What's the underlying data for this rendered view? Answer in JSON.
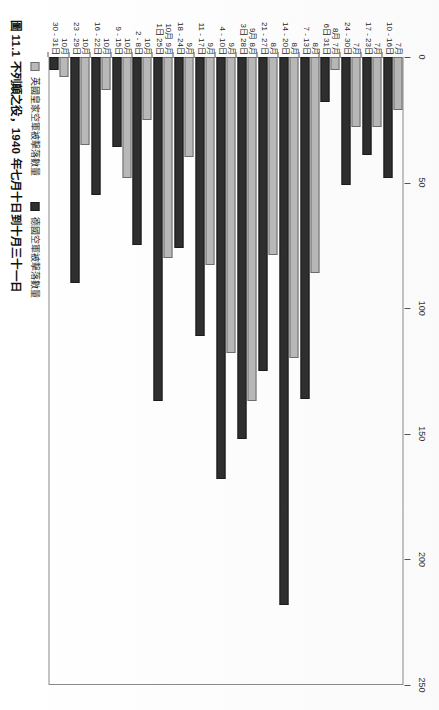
{
  "caption": {
    "number": "圖 11.1",
    "text": "不列顛之役，1940 年七月十日到十月三十一日",
    "full": "圖 11.1 不列顛之役，1940 年七月十日到十月三十一日"
  },
  "legend": {
    "items": [
      {
        "key": "raf",
        "label": "英國皇家空軍被擊落數量",
        "color": "#b9b9b9"
      },
      {
        "key": "luft",
        "label": "德國空軍被擊落數量",
        "color": "#2f2f2f"
      }
    ]
  },
  "chart_data": {
    "type": "bar",
    "title": "圖 11.1 不列顛之役，1940 年七月十日到十月三十一日",
    "orientation": "horizontal",
    "xlabel": "",
    "ylabel": "",
    "xlim": [
      0,
      250
    ],
    "ticks": [
      0,
      50,
      100,
      150,
      200,
      250
    ],
    "tick_labels": [
      "0",
      "50",
      "100",
      "150",
      "200",
      "250"
    ],
    "grid": false,
    "legend_position": "bottom-left",
    "categories": [
      "7月10 - 16日",
      "7月17 - 23日",
      "7月24 - 30日",
      "7月31日 - 8月6日",
      "8月7 - 13日",
      "8月14 - 20日",
      "8月21 - 27日",
      "8月28日 - 9月3日",
      "9月4 - 10日",
      "9月11 - 17日",
      "9月18 - 24日",
      "9月25日 - 10月1日",
      "10月2 - 8日",
      "10月9 - 15日",
      "10月16 - 22日",
      "10月23 - 29日",
      "10月30 - 31日"
    ],
    "category_lines": [
      [
        "7月",
        "10 - 16日"
      ],
      [
        "7月",
        "17 - 23日"
      ],
      [
        "7月",
        "24 - 30日"
      ],
      [
        "8月 7月",
        "6日 31日"
      ],
      [
        "8月",
        "7 - 13日"
      ],
      [
        "8月",
        "14 - 20日"
      ],
      [
        "8月",
        "21 - 27日"
      ],
      [
        "9月 8月",
        "3日 28日"
      ],
      [
        "9月",
        "4 - 10日"
      ],
      [
        "9月",
        "11 - 17日"
      ],
      [
        "9月",
        "18 - 24日"
      ],
      [
        "10月 9月",
        "1日 25日"
      ],
      [
        "10月",
        "2 - 8日"
      ],
      [
        "10月",
        "9 - 15日"
      ],
      [
        "10月",
        "16 - 22日"
      ],
      [
        "10月",
        "23 - 29日"
      ],
      [
        "10月",
        "30 - 31日"
      ]
    ],
    "series": [
      {
        "name": "英國皇家空軍被擊落數量",
        "key": "raf",
        "color": "#b9b9b9",
        "values": [
          21,
          28,
          28,
          5,
          86,
          120,
          79,
          137,
          118,
          83,
          40,
          80,
          25,
          48,
          13,
          35,
          8
        ]
      },
      {
        "name": "德國空軍被擊落數量",
        "key": "luft",
        "color": "#2f2f2f",
        "values": [
          48,
          39,
          51,
          18,
          136,
          218,
          125,
          152,
          168,
          111,
          76,
          137,
          75,
          36,
          55,
          90,
          5
        ]
      }
    ]
  }
}
